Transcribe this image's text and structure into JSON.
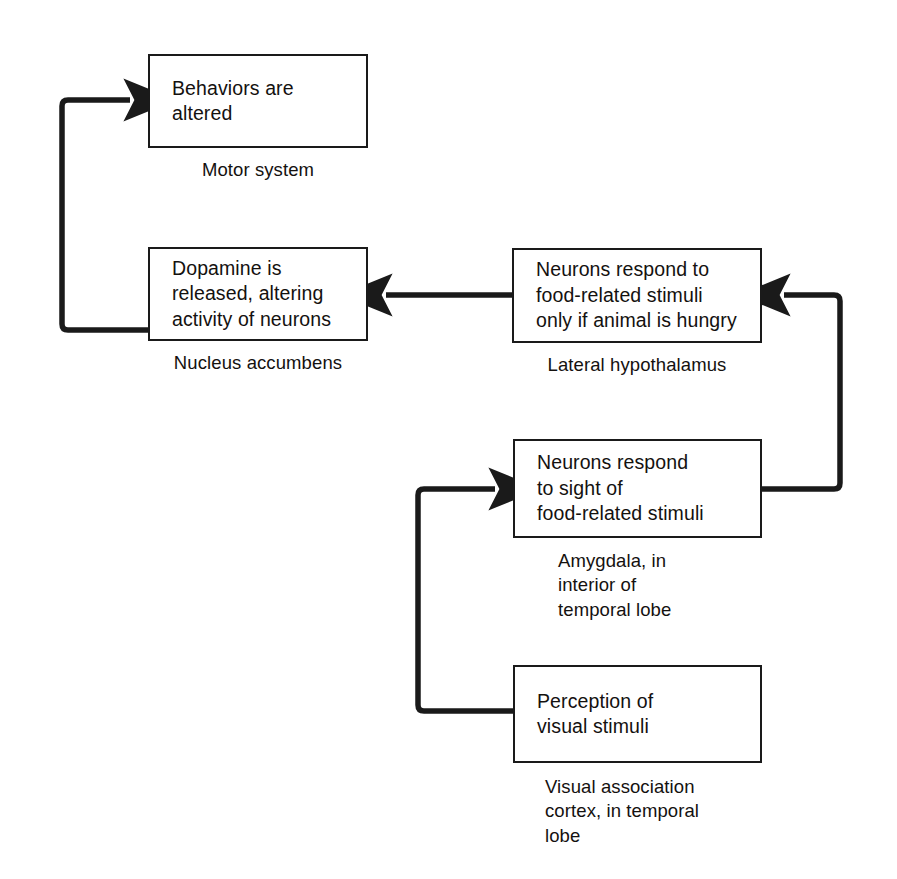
{
  "diagram": {
    "stroke_color": "#1a1a1a",
    "background_color": "#ffffff",
    "nodes": [
      {
        "id": "motor",
        "text": "Behaviors are\naltered",
        "caption": "Motor system",
        "caption_align": "center"
      },
      {
        "id": "accumbens",
        "text": "Dopamine is\nreleased, altering\nactivity of neurons",
        "caption": "Nucleus accumbens",
        "caption_align": "center"
      },
      {
        "id": "hypothalamus",
        "text": "Neurons respond to\nfood-related stimuli\nonly if animal is hungry",
        "caption": "Lateral hypothalamus",
        "caption_align": "center"
      },
      {
        "id": "amygdala",
        "text": "Neurons respond\nto sight of\nfood-related stimuli",
        "caption": "Amygdala, in\ninterior of\ntemporal lobe",
        "caption_align": "left"
      },
      {
        "id": "visual-cortex",
        "text": "Perception of\nvisual stimuli",
        "caption": "Visual association\ncortex, in temporal\nlobe",
        "caption_align": "left"
      }
    ],
    "connectors": [
      {
        "id": "hypothalamus-to-accumbens",
        "from": "hypothalamus",
        "to": "accumbens",
        "arrow": true
      },
      {
        "id": "accumbens-to-motor",
        "from": "accumbens",
        "to": "motor",
        "arrow": true
      },
      {
        "id": "amygdala-to-hypothalamus",
        "from": "amygdala",
        "to": "hypothalamus",
        "arrow": true
      },
      {
        "id": "visual-cortex-to-amygdala",
        "from": "visual-cortex",
        "to": "amygdala",
        "arrow": true
      }
    ]
  }
}
